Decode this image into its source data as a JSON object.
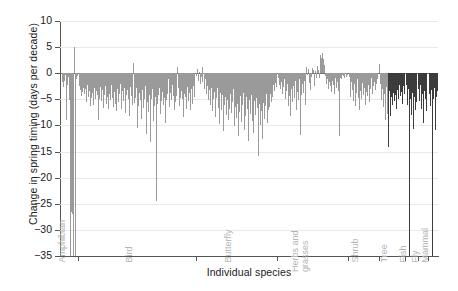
{
  "chart_data": {
    "type": "bar",
    "title": "",
    "xlabel": "Individual species",
    "ylabel": "Change in spring timing (days per decade)",
    "ylim": [
      -35,
      10
    ],
    "yticks": [
      10,
      5,
      0,
      -5,
      -10,
      -15,
      -20,
      -25,
      -30,
      -35
    ],
    "ytick_labels": [
      "10",
      "5",
      "0",
      "-5",
      "-10",
      "-15",
      "-20",
      "-25",
      "-30",
      "-35"
    ],
    "grid": true,
    "legend": "none",
    "bar_color": "#9a9a9a",
    "bar_color_dark": "#3c3c3c",
    "group_labels": [
      "Amphibian",
      "Bird",
      "Butterfly",
      "Herbs and\ngrasses",
      "Shrub",
      "Tree",
      "Fish",
      "Fly",
      "Mammal"
    ],
    "groups": [
      {
        "name": "Amphibian",
        "label": "Amphibian",
        "values": [
          -1.6,
          -0.9,
          -2.6,
          -1.4,
          -0.4,
          -9.0,
          -2.2,
          -0.7,
          -5.1,
          -1.0,
          -35.0,
          -26.5,
          -27.0,
          -35.0,
          5.1,
          -35.0,
          -1.2,
          -0.6
        ]
      },
      {
        "name": "Bird",
        "label": "Bird",
        "values": [
          -2.4,
          -3.2,
          -2.0,
          -4.4,
          -3.6,
          -2.8,
          -4.0,
          -3.0,
          -5.6,
          -2.2,
          -4.6,
          -3.4,
          -6.2,
          -2.6,
          -4.8,
          -3.8,
          -6.0,
          -2.9,
          -5.0,
          -3.5,
          -4.2,
          -9.0,
          -3.1,
          -4.9,
          -2.7,
          -5.4,
          -3.3,
          -6.6,
          -4.1,
          -2.5,
          -5.8,
          -3.7,
          -4.5,
          -6.9,
          -3.9,
          -5.2,
          -2.3,
          -4.7,
          -6.4,
          -3.6,
          -5.9,
          -4.3,
          -7.2,
          -3.0,
          -5.5,
          -4.0,
          -2.1,
          -6.8,
          -3.4,
          -4.6,
          -5.3,
          -2.8,
          -7.6,
          -4.2,
          -3.2,
          -5.0,
          -8.1,
          -2.6,
          -4.4,
          -6.1,
          -3.5,
          1.9,
          -5.7,
          -4.8,
          -2.9,
          -10.4,
          -6.3,
          -3.8,
          -5.1,
          -4.4,
          -8.8,
          -3.3,
          -6.7,
          -4.9,
          -2.4,
          -11.6,
          -5.6,
          -3.9,
          -7.4,
          -4.2,
          -13.1,
          -5.0,
          -3.1,
          -9.2,
          -6.2,
          -4.6,
          -24.5,
          -3.7,
          -5.8,
          -4.1,
          -2.8,
          -7.9,
          -5.4,
          -3.6,
          -6.0,
          -4.7,
          -9.6,
          -3.2,
          -5.2,
          -4.0,
          -1.1,
          -6.5,
          -3.8,
          -5.1,
          -2.2,
          -4.4,
          -7.1,
          -3.0,
          -5.6,
          -4.3,
          1.2,
          -2.9,
          -6.2,
          -4.8,
          -3.4,
          -5.0,
          -2.0,
          -8.4,
          -3.9,
          -4.5,
          -6.8,
          -2.6,
          -5.3,
          -3.7,
          -4.2,
          -7.0,
          -3.1,
          -5.9,
          -2.5,
          -4.6
        ]
      },
      {
        "name": "Butterfly",
        "label": "Butterfly",
        "values": [
          -0.5,
          0.8,
          -1.4,
          0.3,
          -2.0,
          -0.8,
          1.1,
          -1.7,
          -0.2,
          -3.0,
          -1.2,
          -4.0,
          -2.4,
          -5.1,
          -3.3,
          -6.0,
          -4.4,
          -2.8,
          -7.2,
          -5.0,
          -3.6,
          -8.4,
          -4.8,
          -2.9,
          -6.6,
          -9.8,
          -5.4,
          -3.8,
          -7.0,
          -4.2,
          -11.0,
          -6.1,
          -4.6,
          -8.0,
          -5.2,
          -3.4,
          -9.0,
          -6.8,
          -4.0,
          -7.6,
          -5.6,
          -3.1,
          -10.2,
          -6.4,
          -4.9,
          -8.6,
          -5.8,
          -12.0,
          -7.4,
          -4.3,
          -9.4,
          -6.0,
          -3.7,
          -10.8,
          -5.5,
          -8.2,
          -4.5,
          -6.9,
          -13.0,
          -5.1,
          -7.8,
          -4.1,
          -9.2,
          -6.3,
          -11.4,
          -5.3,
          -8.0,
          -4.7,
          -6.6,
          -15.8,
          -5.9,
          -10.0,
          -4.4,
          -7.2,
          -12.6,
          -5.7,
          -8.8,
          -6.2,
          -4.0,
          -9.6,
          -7.0,
          -5.0,
          -6.4,
          -3.9,
          -5.6,
          -4.6,
          -2.2,
          -3.4,
          -1.8,
          -2.6
        ]
      },
      {
        "name": "Herbs and grasses",
        "label": "Herbs and\ngrasses",
        "values": [
          -1.0,
          -2.2,
          -0.6,
          -3.1,
          -1.6,
          -4.0,
          -2.6,
          -1.2,
          -5.0,
          -3.4,
          -2.0,
          -6.2,
          -4.4,
          -1.8,
          -8.2,
          -3.0,
          -5.6,
          -2.4,
          -4.8,
          -1.4,
          -7.0,
          -3.6,
          -2.8,
          -5.2,
          -1.1,
          -11.8,
          -4.2,
          -2.1,
          -3.8,
          -1.5,
          -6.0,
          -2.9,
          1.2,
          -0.4,
          0.9,
          -1.9,
          -3.2,
          -0.8,
          1.0,
          0.6,
          -2.4,
          -1.3,
          0.4,
          -0.9,
          1.4,
          0.7,
          -1.0,
          3.4,
          3.0,
          3.8,
          3.2,
          2.8,
          1.6,
          -0.5,
          -2.0,
          -1.1,
          -3.0,
          -1.7,
          -2.5,
          -0.7,
          -3.6,
          -1.4,
          -2.2,
          -4.0,
          -1.0,
          -2.8,
          -1.6,
          -3.4,
          -12.0,
          -2.0,
          -0.9,
          -1.2,
          -0.3,
          -0.6,
          -1.0,
          -0.2,
          -0.8,
          -0.4
        ]
      },
      {
        "name": "Shrub",
        "label": "Shrub",
        "values": [
          -0.8,
          -2.4,
          -4.6,
          -1.6,
          -3.2,
          -5.4,
          -2.0,
          -6.2,
          -3.8,
          -1.2,
          -4.8,
          -2.6,
          -7.0,
          -3.4,
          -5.0,
          -1.8,
          -4.2,
          -2.8,
          -6.0,
          -3.6,
          -1.4,
          -4.4,
          -2.2,
          -5.6,
          -3.0,
          -1.0,
          -4.0,
          -2.4,
          -1.6,
          -3.2,
          -0.6,
          -2.0,
          -1.2
        ]
      },
      {
        "name": "Tree",
        "label": "Tree",
        "values": [
          1.8,
          -2.0,
          -5.2,
          -3.0,
          -6.4,
          -4.0,
          -9.0,
          -2.6,
          -7.8,
          -5.0,
          -14.2,
          -3.4,
          -8.2,
          -4.6,
          -6.0,
          -3.8,
          -5.4,
          -2.8,
          -4.2,
          -6.8,
          -3.2,
          -5.0,
          -2.2,
          -4.4,
          -3.6,
          -5.8,
          -2.4,
          -4.0
        ]
      },
      {
        "name": "Fish",
        "label": "Fish",
        "values": [
          -2.2,
          -4.0,
          -6.0,
          -3.0,
          -35.0,
          -5.0,
          -8.0,
          -3.8,
          -10.6,
          -4.6,
          -7.0,
          -2.8,
          -5.6
        ]
      },
      {
        "name": "Fly",
        "label": "Fly",
        "values": [
          -3.0,
          -5.4,
          -2.2,
          -6.8,
          -4.0,
          -9.6,
          -3.4,
          -5.0,
          -2.6,
          -7.2
        ]
      },
      {
        "name": "Mammal",
        "label": "Mammal",
        "values": [
          -4.0,
          -2.4,
          -6.2,
          -3.2,
          -35.0,
          -5.0,
          -2.8,
          -10.8,
          -4.6,
          -3.4
        ]
      }
    ]
  }
}
